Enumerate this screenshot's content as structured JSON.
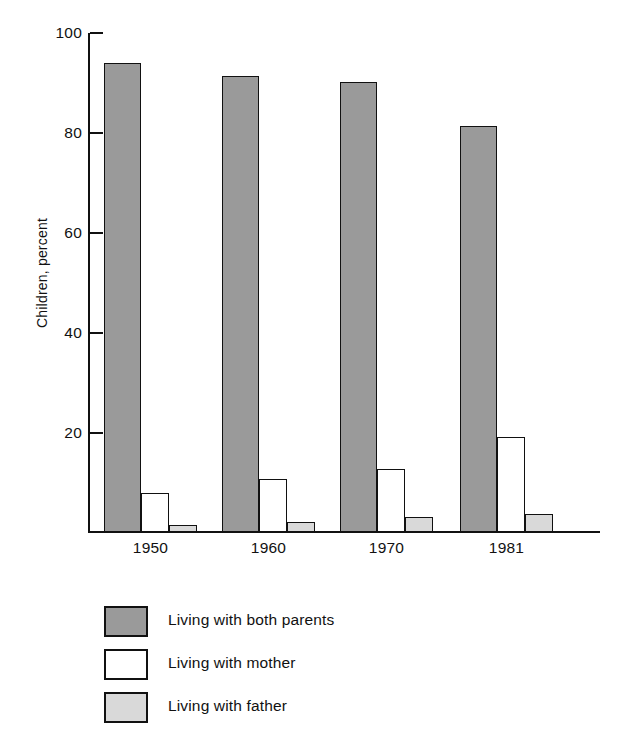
{
  "chart_data": {
    "type": "bar",
    "title": "",
    "subtitle": "",
    "xlabel": "",
    "ylabel": "Children, percent",
    "categories": [
      "1950",
      "1960",
      "1970",
      "1981"
    ],
    "series": [
      {
        "name": "Living with both parents",
        "values": [
          94,
          91.5,
          90.3,
          81.4
        ],
        "color": "#9a9a9a"
      },
      {
        "name": "Living with mother",
        "values": [
          8.1,
          10.8,
          12.9,
          19.3
        ],
        "color": "#ffffff"
      },
      {
        "name": "Living with father",
        "values": [
          1.6,
          2.3,
          3.2,
          3.8
        ],
        "color": "#d9d9d9"
      }
    ],
    "ylim": [
      0,
      100
    ],
    "yticks": [
      0,
      20,
      40,
      60,
      80,
      100
    ],
    "ytick_labels": [
      "",
      "20",
      "40",
      "60",
      "80",
      "100"
    ],
    "grid": false,
    "legend_position": "bottom-left",
    "axis_color": "#111111",
    "background": "#ffffff"
  },
  "axes": {
    "y_title": "Children, percent",
    "y_ticks": [
      {
        "label": "100",
        "value": 100
      },
      {
        "label": "80",
        "value": 80
      },
      {
        "label": "60",
        "value": 60
      },
      {
        "label": "40",
        "value": 40
      },
      {
        "label": "20",
        "value": 20
      }
    ],
    "x_labels": [
      "1950",
      "1960",
      "1970",
      "1981"
    ]
  },
  "legend": {
    "items": [
      {
        "label": "Living with both parents",
        "color": "#9a9a9a",
        "key": "both"
      },
      {
        "label": "Living with mother",
        "color": "#ffffff",
        "key": "mother"
      },
      {
        "label": "Living with father",
        "color": "#d9d9d9",
        "key": "father"
      }
    ]
  }
}
